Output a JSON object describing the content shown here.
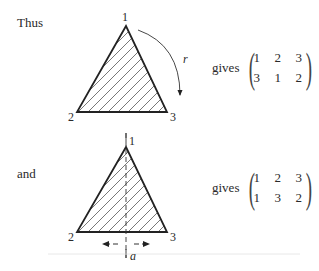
{
  "figure1": {
    "intro_word": "Thus",
    "vertex_labels": {
      "top": "1",
      "left": "2",
      "right": "3"
    },
    "rotation_label": "r",
    "gives_label": "gives",
    "matrix": [
      [
        "1",
        "2",
        "3"
      ],
      [
        "3",
        "1",
        "2"
      ]
    ]
  },
  "figure2": {
    "intro_word": "and",
    "vertex_labels": {
      "top": "1",
      "left": "2",
      "right": "3"
    },
    "axis_label": "a",
    "gives_label": "gives",
    "matrix": [
      [
        "1",
        "2",
        "3"
      ],
      [
        "1",
        "3",
        "2"
      ]
    ]
  }
}
